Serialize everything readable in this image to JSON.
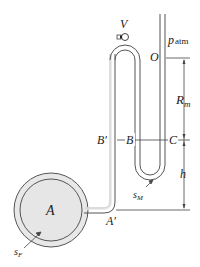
{
  "diagram": {
    "labels": {
      "V": "V",
      "p": "p",
      "p_sub": "atm",
      "O": "O",
      "R": "R",
      "R_sub": "m",
      "B_prime": "B′",
      "B": "B",
      "C": "C",
      "h": "h",
      "s": "s",
      "sM_sub": "M",
      "A": "A",
      "A_prime": "A′",
      "sF_sub": "F"
    },
    "colors": {
      "stroke": "#444444",
      "vessel_fill": "#e6e6e6",
      "tube_fill": "#e8e8e8",
      "text": "#222222"
    }
  }
}
